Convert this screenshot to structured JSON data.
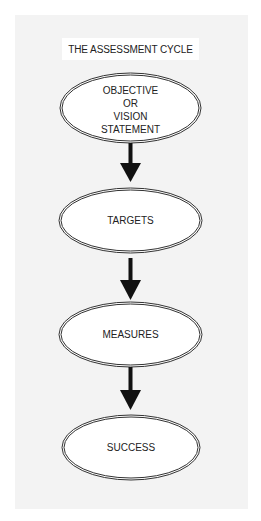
{
  "title": "THE ASSESSMENT CYCLE",
  "colors": {
    "background": "#ffffff",
    "panel": "#f3f3f3",
    "ellipse_fill": "#ffffff",
    "ellipse_stroke": "#333333",
    "arrow": "#111111",
    "text": "#222222"
  },
  "nodes": [
    {
      "id": "objective",
      "lines": [
        "OBJECTIVE",
        "OR",
        "VISION",
        "STATEMENT"
      ]
    },
    {
      "id": "targets",
      "lines": [
        "TARGETS"
      ]
    },
    {
      "id": "measures",
      "lines": [
        "MEASURES"
      ]
    },
    {
      "id": "success",
      "lines": [
        "SUCCESS"
      ]
    }
  ],
  "edges": [
    {
      "from": "objective",
      "to": "targets"
    },
    {
      "from": "targets",
      "to": "measures"
    },
    {
      "from": "measures",
      "to": "success"
    }
  ]
}
